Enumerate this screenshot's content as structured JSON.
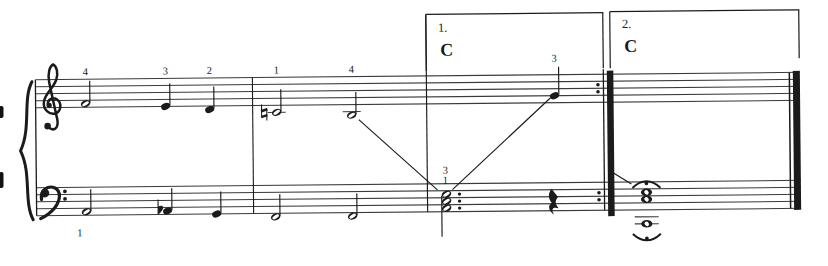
{
  "page": {
    "width": 828,
    "height": 266,
    "background": "#ffffff",
    "ink": "#1b1b1b",
    "staff_line_color": "#3a3a3a",
    "scan_skew_deg": -0.55
  },
  "score": {
    "system": {
      "brace": true,
      "staves": [
        {
          "clef": "treble"
        },
        {
          "clef": "bass"
        }
      ],
      "staff_x_start": 36,
      "staff_x_end": 800
    },
    "endings": [
      {
        "label": "1.",
        "chord_symbol": "C",
        "x_start": 427,
        "x_end": 604
      },
      {
        "label": "2.",
        "chord_symbol": "C",
        "x_start": 611,
        "x_end": 800
      }
    ],
    "barlines": [
      {
        "type": "system-start",
        "x": 36
      },
      {
        "type": "single",
        "x": 253
      },
      {
        "type": "single",
        "x": 427
      },
      {
        "type": "end-repeat",
        "x": 604
      },
      {
        "type": "final",
        "x": 790
      }
    ],
    "treble_notes": [
      {
        "pitch": "F4",
        "type": "half",
        "x": 86,
        "finger": "4"
      },
      {
        "pitch": "E4",
        "type": "quarter",
        "x": 166,
        "finger": "3"
      },
      {
        "pitch": "D4",
        "type": "quarter",
        "x": 210,
        "finger": "2"
      },
      {
        "pitch": "C4",
        "type": "half",
        "x": 277,
        "finger": "1",
        "accidental": "natural",
        "ledger": true
      },
      {
        "pitch": "B3",
        "type": "half",
        "x": 352,
        "finger": "4",
        "ledger": true
      },
      {
        "pitch": "G4",
        "type": "quarter",
        "x": 555,
        "finger": "3",
        "stem_top": 68,
        "finger_y": 63
      }
    ],
    "bass_notes": [
      {
        "pitch": "A2",
        "type": "half",
        "x": 86,
        "finger": "1",
        "finger_below": true,
        "finger_y": 233
      },
      {
        "pitch": "Ab2",
        "type": "quarter",
        "x": 167,
        "accidental": "flat"
      },
      {
        "pitch": "G2",
        "type": "quarter",
        "x": 216
      },
      {
        "pitch": "F2",
        "type": "half",
        "x": 275
      },
      {
        "pitch": "F2",
        "type": "half",
        "x": 352
      }
    ],
    "ending1_chord": {
      "pitches": [
        "E3",
        "C3",
        "A2"
      ],
      "type": "dotted-half",
      "x": 446,
      "fingers": [
        "3",
        "1"
      ],
      "stem": "down"
    },
    "ending1_rest": {
      "type": "quarter-rest",
      "x": 551
    },
    "ending2": {
      "chord": {
        "pitches": [
          "E3",
          "C3"
        ],
        "type": "whole",
        "x": 646,
        "fermata": "above"
      },
      "low_note": {
        "pitch": "C2",
        "type": "whole",
        "x": 646,
        "fermata": "below",
        "ledger_lines": 2
      }
    },
    "hand_guide_lines": [
      {
        "x1": 359,
        "y1": 119,
        "x2": 437,
        "y2": 190
      },
      {
        "x1": 452,
        "y1": 190,
        "x2": 551,
        "y2": 99
      },
      {
        "x1": 612,
        "y1": 174,
        "x2": 631,
        "y2": 186
      }
    ],
    "edge_artifacts": [
      {
        "y1": 106,
        "y2": 118
      },
      {
        "y1": 172,
        "y2": 188
      }
    ]
  }
}
